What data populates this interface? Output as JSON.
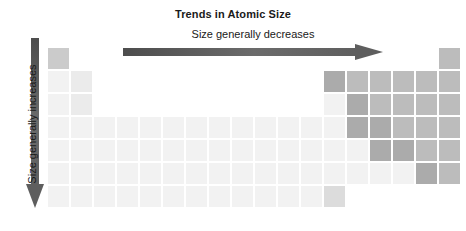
{
  "title": "Trends in Atomic Size",
  "horizontal_arrow": {
    "label": "Size generally decreases",
    "direction": "right",
    "color": "#595959"
  },
  "vertical_arrow": {
    "label": "Size generally increases",
    "direction": "down",
    "color": "#595959"
  },
  "palette": {
    "lightest": "#f2f2f2",
    "light": "#ebebeb",
    "mid_light": "#dcdcdc",
    "mid": "#cbcbcb",
    "mid_dark": "#bcbcbc",
    "dark": "#ababab",
    "background": "#ffffff"
  },
  "grid": {
    "cell_size": 21,
    "cell_pitch": 23,
    "origin_x": 48,
    "origin_y": 48,
    "columns": 18,
    "rows": 8,
    "cells": [
      {
        "col": 1,
        "row": 1,
        "shade": "mid"
      },
      {
        "col": 18,
        "row": 1,
        "shade": "mid_dark"
      },
      {
        "col": 1,
        "row": 2,
        "shade": "lightest"
      },
      {
        "col": 2,
        "row": 2,
        "shade": "light"
      },
      {
        "col": 13,
        "row": 2,
        "shade": "dark"
      },
      {
        "col": 14,
        "row": 2,
        "shade": "mid_dark"
      },
      {
        "col": 15,
        "row": 2,
        "shade": "mid_dark"
      },
      {
        "col": 16,
        "row": 2,
        "shade": "mid_dark"
      },
      {
        "col": 17,
        "row": 2,
        "shade": "mid_dark"
      },
      {
        "col": 18,
        "row": 2,
        "shade": "mid_dark"
      },
      {
        "col": 1,
        "row": 3,
        "shade": "lightest"
      },
      {
        "col": 2,
        "row": 3,
        "shade": "light"
      },
      {
        "col": 13,
        "row": 3,
        "shade": "lightest"
      },
      {
        "col": 14,
        "row": 3,
        "shade": "dark"
      },
      {
        "col": 15,
        "row": 3,
        "shade": "mid_dark"
      },
      {
        "col": 16,
        "row": 3,
        "shade": "mid_dark"
      },
      {
        "col": 17,
        "row": 3,
        "shade": "mid_dark"
      },
      {
        "col": 18,
        "row": 3,
        "shade": "mid_dark"
      },
      {
        "col": 1,
        "row": 4,
        "shade": "lightest"
      },
      {
        "col": 2,
        "row": 4,
        "shade": "lightest"
      },
      {
        "col": 3,
        "row": 4,
        "shade": "lightest"
      },
      {
        "col": 4,
        "row": 4,
        "shade": "lightest"
      },
      {
        "col": 5,
        "row": 4,
        "shade": "lightest"
      },
      {
        "col": 6,
        "row": 4,
        "shade": "lightest"
      },
      {
        "col": 7,
        "row": 4,
        "shade": "lightest"
      },
      {
        "col": 8,
        "row": 4,
        "shade": "lightest"
      },
      {
        "col": 9,
        "row": 4,
        "shade": "lightest"
      },
      {
        "col": 10,
        "row": 4,
        "shade": "lightest"
      },
      {
        "col": 11,
        "row": 4,
        "shade": "lightest"
      },
      {
        "col": 12,
        "row": 4,
        "shade": "lightest"
      },
      {
        "col": 13,
        "row": 4,
        "shade": "lightest"
      },
      {
        "col": 14,
        "row": 4,
        "shade": "dark"
      },
      {
        "col": 15,
        "row": 4,
        "shade": "dark"
      },
      {
        "col": 16,
        "row": 4,
        "shade": "mid_dark"
      },
      {
        "col": 17,
        "row": 4,
        "shade": "mid_dark"
      },
      {
        "col": 18,
        "row": 4,
        "shade": "mid_dark"
      },
      {
        "col": 1,
        "row": 5,
        "shade": "lightest"
      },
      {
        "col": 2,
        "row": 5,
        "shade": "lightest"
      },
      {
        "col": 3,
        "row": 5,
        "shade": "lightest"
      },
      {
        "col": 4,
        "row": 5,
        "shade": "lightest"
      },
      {
        "col": 5,
        "row": 5,
        "shade": "lightest"
      },
      {
        "col": 6,
        "row": 5,
        "shade": "lightest"
      },
      {
        "col": 7,
        "row": 5,
        "shade": "lightest"
      },
      {
        "col": 8,
        "row": 5,
        "shade": "lightest"
      },
      {
        "col": 9,
        "row": 5,
        "shade": "lightest"
      },
      {
        "col": 10,
        "row": 5,
        "shade": "lightest"
      },
      {
        "col": 11,
        "row": 5,
        "shade": "lightest"
      },
      {
        "col": 12,
        "row": 5,
        "shade": "lightest"
      },
      {
        "col": 13,
        "row": 5,
        "shade": "lightest"
      },
      {
        "col": 14,
        "row": 5,
        "shade": "lightest"
      },
      {
        "col": 15,
        "row": 5,
        "shade": "dark"
      },
      {
        "col": 16,
        "row": 5,
        "shade": "dark"
      },
      {
        "col": 17,
        "row": 5,
        "shade": "mid_dark"
      },
      {
        "col": 18,
        "row": 5,
        "shade": "mid_dark"
      },
      {
        "col": 1,
        "row": 6,
        "shade": "lightest"
      },
      {
        "col": 2,
        "row": 6,
        "shade": "lightest"
      },
      {
        "col": 3,
        "row": 6,
        "shade": "lightest"
      },
      {
        "col": 4,
        "row": 6,
        "shade": "lightest"
      },
      {
        "col": 5,
        "row": 6,
        "shade": "lightest"
      },
      {
        "col": 6,
        "row": 6,
        "shade": "lightest"
      },
      {
        "col": 7,
        "row": 6,
        "shade": "lightest"
      },
      {
        "col": 8,
        "row": 6,
        "shade": "lightest"
      },
      {
        "col": 9,
        "row": 6,
        "shade": "lightest"
      },
      {
        "col": 10,
        "row": 6,
        "shade": "lightest"
      },
      {
        "col": 11,
        "row": 6,
        "shade": "lightest"
      },
      {
        "col": 12,
        "row": 6,
        "shade": "lightest"
      },
      {
        "col": 13,
        "row": 6,
        "shade": "lightest"
      },
      {
        "col": 14,
        "row": 6,
        "shade": "lightest"
      },
      {
        "col": 15,
        "row": 6,
        "shade": "lightest"
      },
      {
        "col": 16,
        "row": 6,
        "shade": "lightest"
      },
      {
        "col": 17,
        "row": 6,
        "shade": "dark"
      },
      {
        "col": 18,
        "row": 6,
        "shade": "mid_dark"
      },
      {
        "col": 1,
        "row": 7,
        "shade": "lightest"
      },
      {
        "col": 2,
        "row": 7,
        "shade": "lightest"
      },
      {
        "col": 3,
        "row": 7,
        "shade": "lightest"
      },
      {
        "col": 4,
        "row": 7,
        "shade": "lightest"
      },
      {
        "col": 5,
        "row": 7,
        "shade": "lightest"
      },
      {
        "col": 6,
        "row": 7,
        "shade": "lightest"
      },
      {
        "col": 7,
        "row": 7,
        "shade": "lightest"
      },
      {
        "col": 8,
        "row": 7,
        "shade": "lightest"
      },
      {
        "col": 9,
        "row": 7,
        "shade": "lightest"
      },
      {
        "col": 10,
        "row": 7,
        "shade": "lightest"
      },
      {
        "col": 11,
        "row": 7,
        "shade": "lightest"
      },
      {
        "col": 12,
        "row": 7,
        "shade": "lightest"
      },
      {
        "col": 13,
        "row": 7,
        "shade": "mid_light"
      }
    ]
  }
}
